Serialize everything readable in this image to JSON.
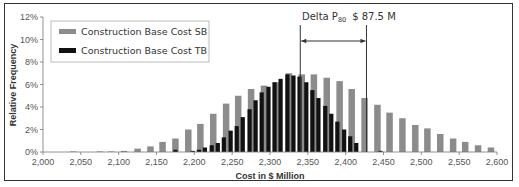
{
  "chart_data": {
    "type": "bar",
    "title": "",
    "xlabel": "Cost in $ Million",
    "ylabel": "Relative Frequency",
    "xlim": [
      2000,
      2600
    ],
    "ylim": [
      0,
      12
    ],
    "x_ticks": [
      "2,000",
      "2,050",
      "2,100",
      "2,150",
      "2,200",
      "2,250",
      "2,300",
      "2,350",
      "2,400",
      "2,450",
      "2,500",
      "2,550",
      "2,600"
    ],
    "y_ticks": [
      "0%",
      "2%",
      "4%",
      "6%",
      "8%",
      "10%",
      "12%"
    ],
    "grid": false,
    "legend_position": "upper-left",
    "series": [
      {
        "name": "Construction Base Cost SB",
        "color": "#8c8c8c",
        "x": [
          2040,
          2075,
          2090,
          2107,
          2125,
          2142,
          2158,
          2175,
          2192,
          2208,
          2225,
          2242,
          2258,
          2275,
          2292,
          2308,
          2325,
          2342,
          2358,
          2375,
          2392,
          2408,
          2425,
          2442,
          2458,
          2475,
          2492,
          2508,
          2525,
          2542,
          2558,
          2575,
          2592
        ],
        "values": [
          0.05,
          0.05,
          0.05,
          0.1,
          0.3,
          0.5,
          0.9,
          1.2,
          2.0,
          2.5,
          3.4,
          4.3,
          5.0,
          5.6,
          5.9,
          6.2,
          7.0,
          6.9,
          6.9,
          6.6,
          6.3,
          5.6,
          4.8,
          4.2,
          3.5,
          3.0,
          2.4,
          2.1,
          1.6,
          1.2,
          0.9,
          0.6,
          0.4
        ]
      },
      {
        "name": "Construction Base Cost TB",
        "color": "#111111",
        "x": [
          2175,
          2198,
          2206,
          2214,
          2223,
          2231,
          2239,
          2248,
          2256,
          2264,
          2273,
          2281,
          2289,
          2298,
          2306,
          2314,
          2323,
          2331,
          2339,
          2348,
          2356,
          2364,
          2373,
          2381,
          2389,
          2398,
          2406,
          2414,
          2446
        ],
        "values": [
          0.2,
          0.1,
          0.2,
          0.4,
          0.6,
          0.8,
          1.3,
          1.9,
          2.3,
          3.1,
          3.8,
          4.6,
          5.3,
          5.8,
          6.2,
          6.5,
          6.9,
          6.8,
          6.7,
          6.2,
          5.5,
          4.8,
          4.1,
          3.4,
          2.7,
          2.0,
          1.4,
          0.8,
          0.1
        ]
      }
    ],
    "annotations": [
      {
        "text_main": "Delta P",
        "text_sub": "80",
        "text_value": "$ 87.5 M",
        "x_from": 2340,
        "x_to": 2427.5,
        "type": "double-headed-arrow-with-vertical-lines"
      }
    ]
  },
  "legend": {
    "items": [
      {
        "label": "Construction Base Cost SB",
        "color": "#8c8c8c"
      },
      {
        "label": "Construction Base Cost TB",
        "color": "#111111"
      }
    ]
  },
  "axes": {
    "xlabel": "Cost in $ Million",
    "ylabel": "Relative Frequency"
  },
  "annotation": {
    "label": "Delta P",
    "subscript": "80",
    "value": "$ 87.5 M"
  }
}
